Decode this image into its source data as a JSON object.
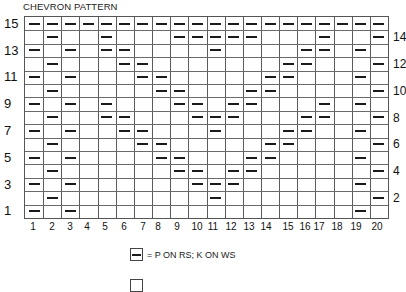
{
  "title": "CHEVRON PATTERN",
  "chart": {
    "columns": 20,
    "rows": 15,
    "column_labels": [
      "1",
      "2",
      "3",
      "4",
      "5",
      "6",
      "7",
      "8",
      "9",
      "10",
      "11",
      "12",
      "13",
      "14",
      "15",
      "16",
      "17",
      "18",
      "19",
      "20"
    ],
    "column_label_x": [
      33,
      52,
      70,
      87,
      105,
      124,
      143,
      158,
      177,
      197,
      213,
      231,
      249,
      266,
      288,
      305,
      319,
      337,
      356,
      377
    ],
    "left_row_labels": [
      "15",
      "13",
      "11",
      "9",
      "7",
      "5",
      "3",
      "1"
    ],
    "right_row_labels": [
      "14",
      "12",
      "10",
      "8",
      "6",
      "4",
      "2"
    ],
    "purl_cells_by_row": {
      "15": [
        1,
        2,
        3,
        4,
        5,
        6,
        7,
        8,
        9,
        10,
        11,
        12,
        13,
        14,
        15,
        16,
        17,
        18,
        19,
        20
      ],
      "14": [
        2,
        5,
        9,
        10,
        11,
        12,
        13,
        17,
        20
      ],
      "13": [
        1,
        3,
        5,
        6,
        11,
        16,
        17,
        19
      ],
      "12": [
        2,
        6,
        7,
        15,
        16,
        20
      ],
      "11": [
        1,
        3,
        7,
        8,
        14,
        15,
        19
      ],
      "10": [
        2,
        8,
        9,
        13,
        14,
        20
      ],
      "9": [
        1,
        3,
        5,
        9,
        10,
        12,
        13,
        17,
        19
      ],
      "8": [
        2,
        5,
        6,
        10,
        11,
        12,
        16,
        17,
        20
      ],
      "7": [
        1,
        3,
        6,
        7,
        11,
        15,
        16,
        19
      ],
      "6": [
        2,
        7,
        8,
        14,
        15,
        20
      ],
      "5": [
        1,
        3,
        8,
        9,
        13,
        14,
        19
      ],
      "4": [
        2,
        9,
        10,
        12,
        13,
        20
      ],
      "3": [
        1,
        3,
        10,
        11,
        12,
        19
      ],
      "2": [
        2,
        11,
        20
      ],
      "1": [
        1,
        3,
        19
      ]
    }
  },
  "legend": [
    {
      "symbol": "dash",
      "text": "= P ON RS; K ON WS"
    },
    {
      "symbol": "blank",
      "text": ""
    }
  ]
}
